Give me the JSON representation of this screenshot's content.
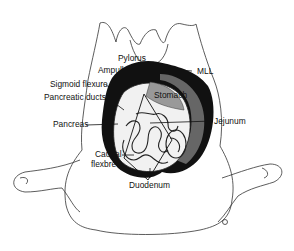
{
  "diagram": {
    "labels": [
      {
        "id": "pylorus",
        "text": "Pylorus",
        "x": 118,
        "y": 57
      },
      {
        "id": "ampulla",
        "text": "Ampulla",
        "x": 98,
        "y": 67
      },
      {
        "id": "sigmoid_flexure",
        "text": "Sigmoid flexure",
        "x": 50,
        "y": 81
      },
      {
        "id": "pancreatic_ducts",
        "text": "Pancreatic ducts",
        "x": 44,
        "y": 94
      },
      {
        "id": "pancreas",
        "text": "Pancreas",
        "x": 53,
        "y": 121
      },
      {
        "id": "mll",
        "text": "MLL",
        "x": 197,
        "y": 67
      },
      {
        "id": "stomach",
        "text": "Stomach",
        "x": 154,
        "y": 92
      },
      {
        "id": "jejunum",
        "text": "Jejunum",
        "x": 214,
        "y": 118
      },
      {
        "id": "caudal_flexure_1",
        "text": "Caudal",
        "x": 95,
        "y": 150
      },
      {
        "id": "caudal_flexure_2",
        "text": "flexbre",
        "x": 91,
        "y": 161
      },
      {
        "id": "duodenum",
        "text": "Duodenum",
        "x": 129,
        "y": 181
      }
    ],
    "colors": {
      "line": "#222222",
      "dark_organ": "#111111",
      "mid_organ": "#555555",
      "light_organ": "#bbbbbb",
      "background": "#ffffff"
    }
  }
}
